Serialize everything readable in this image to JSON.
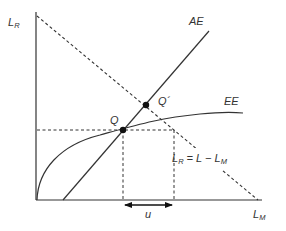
{
  "diagram": {
    "type": "economics-labor-market",
    "axes": {
      "y_label": {
        "main": "L",
        "sub": "R"
      },
      "x_label": {
        "main": "L",
        "sub": "M"
      }
    },
    "curves": [
      {
        "id": "AE",
        "label": "AE",
        "style": "solid"
      },
      {
        "id": "EE",
        "label": "EE",
        "style": "solid"
      },
      {
        "id": "budget",
        "label_main_left": "L",
        "label_sub_left": "R",
        "label_eq": " = L − ",
        "label_main_right": "L",
        "label_sub_right": "M",
        "style": "dashed"
      }
    ],
    "points": [
      {
        "id": "Q",
        "label": "Q"
      },
      {
        "id": "Qprime",
        "label": "Q´"
      }
    ],
    "annotations": [
      {
        "id": "u",
        "label": "u",
        "type": "double-arrow"
      }
    ],
    "colors": {
      "line": "#333333",
      "dashed": "#333333",
      "point": "#111111",
      "background": "#ffffff"
    }
  }
}
